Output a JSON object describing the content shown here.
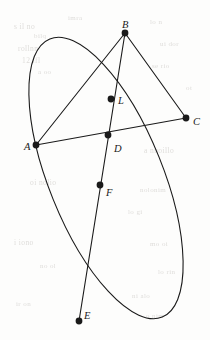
{
  "figure": {
    "canvas": {
      "width": 210,
      "height": 340
    },
    "stroke_color": "#1a1a1a",
    "background_color": "#fdfdfc",
    "ghost_text_color": "#d9d7d4",
    "ellipse": {
      "name": "conic-ellipse",
      "center_x": 106,
      "center_y": 178,
      "radius_x": 57,
      "radius_y": 150,
      "rotation_deg": -22,
      "stroke_width": 1.1
    },
    "points": [
      {
        "id": "B",
        "label": "B",
        "x": 125,
        "y": 33,
        "label_dx": -3,
        "label_dy": -13,
        "dot_r": 3.4
      },
      {
        "id": "L",
        "label": "L",
        "x": 111,
        "y": 99,
        "label_dx": 7,
        "label_dy": -3,
        "dot_r": 3.4
      },
      {
        "id": "C",
        "label": "C",
        "x": 186,
        "y": 118,
        "label_dx": 7,
        "label_dy": -1,
        "dot_r": 3.4
      },
      {
        "id": "D",
        "label": "D",
        "x": 108,
        "y": 135,
        "label_dx": 6,
        "label_dy": 9,
        "dot_r": 3.4
      },
      {
        "id": "A",
        "label": "A",
        "x": 36,
        "y": 145,
        "label_dx": -12,
        "label_dy": -3,
        "dot_r": 3.4
      },
      {
        "id": "F",
        "label": "F",
        "x": 100,
        "y": 185,
        "label_dx": 6,
        "label_dy": 3,
        "dot_r": 3.4
      },
      {
        "id": "E",
        "label": "E",
        "x": 79,
        "y": 321,
        "label_dx": 5,
        "label_dy": -10,
        "dot_r": 3.4
      }
    ],
    "segments": [
      {
        "name": "segment-B-A",
        "from": "B",
        "to": "A",
        "x1": 125,
        "y1": 33,
        "x2": 36,
        "y2": 145,
        "stroke_width": 1.1
      },
      {
        "name": "segment-B-C",
        "from": "B",
        "to": "C",
        "x1": 125,
        "y1": 33,
        "x2": 186,
        "y2": 118,
        "stroke_width": 1.1
      },
      {
        "name": "segment-B-E",
        "from": "B",
        "to": "E",
        "x1": 125,
        "y1": 33,
        "x2": 79,
        "y2": 321,
        "stroke_width": 1.1
      },
      {
        "name": "segment-A-C",
        "from": "A",
        "to": "C",
        "x1": 36,
        "y1": 145,
        "x2": 186,
        "y2": 118,
        "stroke_width": 1.1
      }
    ],
    "ghost_text": [
      {
        "text": "s il  no",
        "x": 14,
        "y": 22,
        "size": 7.5
      },
      {
        "text": "bilq",
        "x": 34,
        "y": 32,
        "size": 7
      },
      {
        "text": "rollnn",
        "x": 18,
        "y": 44,
        "size": 7.5
      },
      {
        "text": "12  ifl",
        "x": 22,
        "y": 56,
        "size": 7.5
      },
      {
        "text": "a  oo",
        "x": 38,
        "y": 68,
        "size": 7
      },
      {
        "text": "imra",
        "x": 68,
        "y": 14,
        "size": 7
      },
      {
        "text": "lo  n",
        "x": 150,
        "y": 18,
        "size": 7
      },
      {
        "text": "ui  dor",
        "x": 160,
        "y": 40,
        "size": 7
      },
      {
        "text": "se  rio",
        "x": 152,
        "y": 62,
        "size": 7
      },
      {
        "text": "ot",
        "x": 186,
        "y": 84,
        "size": 7
      },
      {
        "text": "a  nnoillo",
        "x": 144,
        "y": 146,
        "size": 7.5
      },
      {
        "text": "oi  nolio",
        "x": 30,
        "y": 178,
        "size": 7.5
      },
      {
        "text": "nolonim",
        "x": 140,
        "y": 186,
        "size": 7
      },
      {
        "text": "lo  gi",
        "x": 128,
        "y": 208,
        "size": 7
      },
      {
        "text": "i  iono",
        "x": 14,
        "y": 238,
        "size": 7.5
      },
      {
        "text": "mo  oi",
        "x": 150,
        "y": 240,
        "size": 7
      },
      {
        "text": "no  ol",
        "x": 40,
        "y": 262,
        "size": 7
      },
      {
        "text": "lo  rin",
        "x": 158,
        "y": 268,
        "size": 7
      },
      {
        "text": "ni  alo",
        "x": 132,
        "y": 292,
        "size": 7
      },
      {
        "text": "o  nim",
        "x": 146,
        "y": 312,
        "size": 7
      },
      {
        "text": "ir  on",
        "x": 16,
        "y": 300,
        "size": 7
      }
    ]
  }
}
